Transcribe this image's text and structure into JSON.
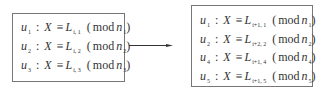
{
  "left_box": {
    "rows": [
      {
        "var": "u",
        "var_sub": "1",
        "lhs": "X",
        "rel": "≡",
        "L": "L",
        "L_sub": "i, 1",
        "mod": "mod",
        "n": "n",
        "n_sub": "1"
      },
      {
        "var": "u",
        "var_sub": "2",
        "lhs": "X",
        "rel": "≡",
        "L": "L",
        "L_sub": "i, 2",
        "mod": "mod",
        "n": "n",
        "n_sub": "2"
      },
      {
        "var": "u",
        "var_sub": "3",
        "lhs": "X",
        "rel": "≡",
        "L": "L",
        "L_sub": "i, 3",
        "mod": "mod",
        "n": "n",
        "n_sub": "3"
      }
    ]
  },
  "arrow": {
    "direction": "right",
    "color": "#333333"
  },
  "right_box": {
    "rows": [
      {
        "var": "u",
        "var_sub": "1",
        "lhs": "X",
        "rel": "≡",
        "L": "L",
        "L_sub": "i+1, 1",
        "mod": "mod",
        "n": "n",
        "n_sub": "1"
      },
      {
        "var": "u",
        "var_sub": "2",
        "lhs": "X",
        "rel": "≡",
        "L": "L",
        "L_sub": "i+2, 2",
        "mod": "mod",
        "n": "n",
        "n_sub": "2"
      },
      {
        "var": "u",
        "var_sub": "4",
        "lhs": "X",
        "rel": "≡",
        "L": "L",
        "L_sub": "i+1, 4",
        "mod": "mod",
        "n": "n",
        "n_sub": "4"
      },
      {
        "var": "u",
        "var_sub": "5",
        "lhs": "X",
        "rel": "≡",
        "L": "L",
        "L_sub": "i+1, 5",
        "mod": "mod",
        "n": "n",
        "n_sub": "5"
      }
    ]
  },
  "symbols": {
    "colon": ":",
    "open_paren": "(",
    "close_paren": ")"
  }
}
